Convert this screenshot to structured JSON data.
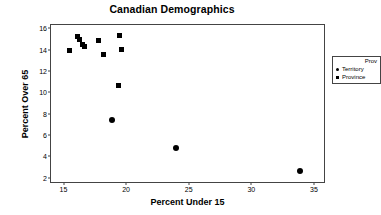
{
  "chart_data": {
    "type": "scatter",
    "title": "Canadian Demographics",
    "xlabel": "Percent Under 15",
    "ylabel": "Percent Over 65",
    "xlim": [
      14.0,
      35.8
    ],
    "ylim": [
      1.6,
      16.3
    ],
    "xticks": [
      "15",
      "20",
      "25",
      "30",
      "35"
    ],
    "xtick_values": [
      15,
      20,
      25,
      30,
      35
    ],
    "yticks": [
      "2",
      "4",
      "6",
      "8",
      "10",
      "12",
      "14",
      "16"
    ],
    "ytick_values": [
      2,
      4,
      6,
      8,
      10,
      12,
      14,
      16
    ],
    "grid": false,
    "legend_position": "top-right",
    "legend_title": "Prov",
    "series": [
      {
        "name": "Territory",
        "marker": "circle",
        "color": "#000000",
        "points": [
          {
            "x": 18.9,
            "y": 7.45
          },
          {
            "x": 24.0,
            "y": 4.8
          },
          {
            "x": 33.9,
            "y": 2.6
          }
        ]
      },
      {
        "name": "Province",
        "marker": "square",
        "color": "#000000",
        "points": [
          {
            "x": 15.5,
            "y": 13.9
          },
          {
            "x": 16.1,
            "y": 15.2
          },
          {
            "x": 16.3,
            "y": 14.9
          },
          {
            "x": 16.5,
            "y": 14.5
          },
          {
            "x": 16.65,
            "y": 14.25
          },
          {
            "x": 17.8,
            "y": 14.85
          },
          {
            "x": 18.2,
            "y": 13.55
          },
          {
            "x": 19.45,
            "y": 15.35
          },
          {
            "x": 19.6,
            "y": 14.0
          },
          {
            "x": 19.4,
            "y": 10.65
          }
        ]
      }
    ]
  }
}
